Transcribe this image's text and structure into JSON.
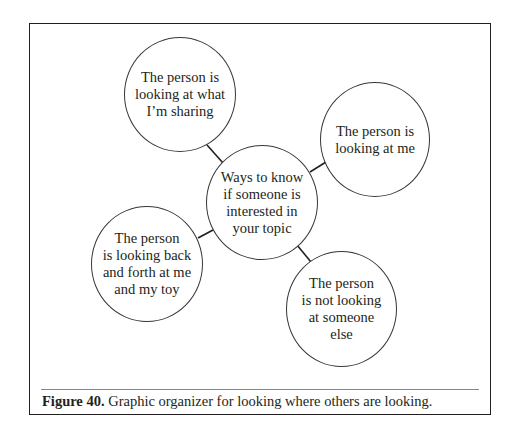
{
  "diagram": {
    "type": "graphic-organizer",
    "center": {
      "text": "Ways to know\nif someone is\ninterested in\nyour topic"
    },
    "nodes": [
      {
        "id": "top-left",
        "text": "The person is\nlooking at what\nI’m sharing"
      },
      {
        "id": "right",
        "text": "The person is\nlooking at me"
      },
      {
        "id": "bottom-left",
        "text": "The person\nis looking back\nand forth at me\nand my toy"
      },
      {
        "id": "bottom-right",
        "text": "The person\nis not looking\nat someone\nelse"
      }
    ]
  },
  "caption": {
    "label": "Figure 40.",
    "text": " Graphic organizer for looking where others are looking."
  },
  "colors": {
    "ink": "#231f20",
    "background": "#ffffff"
  }
}
